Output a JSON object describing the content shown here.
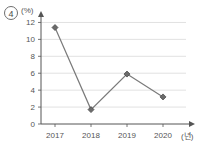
{
  "choice": {
    "marker_label": "4"
  },
  "axes": {
    "y_unit_label": "(%)",
    "x_unit_label": "(년)"
  },
  "chart_data": {
    "type": "line",
    "title": "",
    "subtitle": "",
    "xlabel": "(년)",
    "ylabel": "(%)",
    "categories": [
      "2017",
      "2018",
      "2019",
      "2020"
    ],
    "values": [
      11.4,
      1.7,
      5.9,
      3.2
    ],
    "series": [
      {
        "name": "",
        "values": [
          11.4,
          1.7,
          5.9,
          3.2
        ]
      }
    ],
    "ylim": [
      0,
      13
    ],
    "ytick_labels": [
      "0",
      "2",
      "4",
      "6",
      "8",
      "10",
      "12"
    ],
    "ytick_values": [
      0,
      2,
      4,
      6,
      8,
      10,
      12
    ],
    "xtick_labels": [
      "2017",
      "2018",
      "2019",
      "2020"
    ],
    "grid": true,
    "legend": "none",
    "marker": "diamond",
    "line_color": "#7a7a7a",
    "marker_color": "#6b6b6b",
    "grid_color": "#d9d9d9",
    "axis_color": "#555555"
  }
}
